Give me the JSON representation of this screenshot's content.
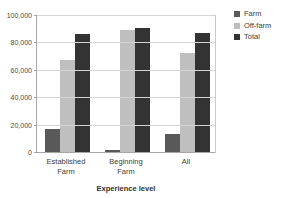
{
  "chart_data": {
    "type": "bar",
    "title": "",
    "xlabel": "Experience level",
    "ylabel": "",
    "categories": [
      "Established\nFarm",
      "Beginning\nFarm",
      "All"
    ],
    "series": [
      {
        "name": "Farm",
        "color": "#595959",
        "values": [
          16500,
          1200,
          13000
        ]
      },
      {
        "name": "Off-farm",
        "color": "#bfbfbf",
        "values": [
          67500,
          89000,
          72000
        ]
      },
      {
        "name": "Total",
        "color": "#333333",
        "values": [
          86000,
          90500,
          87000
        ]
      }
    ],
    "ylim": [
      0,
      100000
    ],
    "yticks": [
      0,
      20000,
      40000,
      60000,
      80000,
      100000
    ],
    "ytick_labels": [
      "0",
      "20,000",
      "40,000",
      "60,000",
      "80,000",
      "100,000"
    ],
    "grid": true,
    "legend_position": "right"
  },
  "legend": {
    "items": [
      {
        "label": "Farm"
      },
      {
        "label": "Off-farm"
      },
      {
        "label": "Total"
      }
    ]
  }
}
